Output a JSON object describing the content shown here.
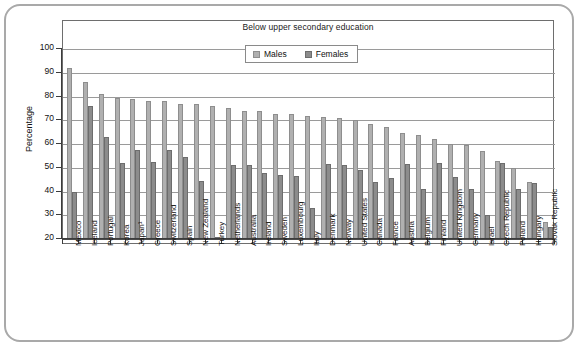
{
  "chart_data": {
    "type": "bar",
    "title": "Below upper secondary education",
    "xlabel": "",
    "ylabel": "Percentage",
    "ylim": [
      20,
      100
    ],
    "ytick_step": 10,
    "yticks": [
      20,
      30,
      40,
      50,
      60,
      70,
      80,
      90,
      100
    ],
    "grid": true,
    "legend_position": "top-center-inside",
    "categories": [
      "Mexico",
      "Iceland",
      "Portugal",
      "Korea",
      "Japan¹",
      "Greece",
      "Switzerland",
      "Spain",
      "New Zealand",
      "Turkey",
      "Netherlands",
      "Australia",
      "Ireland",
      "Sweden",
      "Luxembourg",
      "Italy",
      "Denmark",
      "Norway",
      "United States",
      "Canada",
      "France",
      "Austria",
      "Belgium",
      "Finland",
      "United Kingdom",
      "Germany",
      "Israel",
      "Czech Republic",
      "Poland",
      "Hungary",
      "Slovak Republic"
    ],
    "series": [
      {
        "name": "Males",
        "color": "#b0b0b0",
        "values": [
          92,
          86,
          81,
          79.5,
          79,
          78,
          78,
          77,
          77,
          76,
          75,
          74,
          74,
          72.5,
          72.5,
          72,
          71.5,
          71,
          70,
          68.5,
          67,
          64.5,
          64,
          62,
          60,
          59.5,
          57,
          53,
          50,
          44,
          27
        ]
      },
      {
        "name": "Females",
        "color": "#8c8c8c",
        "values": [
          40,
          76,
          63,
          52,
          57.5,
          52.5,
          57.5,
          54.5,
          44.5,
          21,
          51,
          51,
          48,
          47,
          46.5,
          33,
          51.5,
          51,
          49,
          44,
          45.5,
          51.5,
          41,
          52,
          46,
          41,
          30,
          52,
          41,
          43.5,
          25
        ]
      }
    ]
  }
}
